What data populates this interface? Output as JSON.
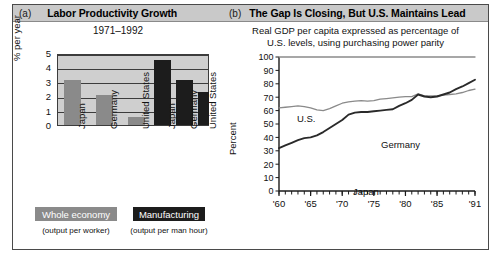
{
  "figure": {
    "panel_a": {
      "letter": "(a)",
      "title": "Labor Productivity Growth",
      "subtitle": "1971–1992",
      "legend": [
        {
          "label": "Whole economy",
          "sub": "(output per worker)",
          "color": "#8a8a8a"
        },
        {
          "label": "Manufacturing",
          "sub": "(output per man hour)",
          "color": "#1c1c1c"
        }
      ]
    },
    "panel_b": {
      "letter": "(b)",
      "title": "The Gap Is Closing, But U.S. Maintains Lead",
      "subtitle_line1": "Real GDP per capita expressed as percentage of",
      "subtitle_line2": "U.S. levels, using purchasing power parity",
      "series_labels": {
        "us": "U.S.",
        "germany": "Germany",
        "japan": "Japan"
      }
    }
  },
  "chart_data": [
    {
      "type": "bar",
      "title": "Labor Productivity Growth",
      "subtitle": "1971–1992",
      "xlabel": "",
      "ylabel": "% per year",
      "ylim": [
        0,
        5
      ],
      "yticks": [
        0,
        1,
        2,
        3,
        4,
        5
      ],
      "grid": true,
      "categories": [
        "Japan",
        "Germany",
        "United States",
        "Japan",
        "Germany",
        "United States"
      ],
      "series": [
        {
          "name": "Whole economy",
          "sublabel": "(output per worker)",
          "color": "#8a8a8a",
          "categories": [
            "Japan",
            "Germany",
            "United States"
          ],
          "values": [
            3.1,
            2.05,
            0.55
          ]
        },
        {
          "name": "Manufacturing",
          "sublabel": "(output per man hour)",
          "color": "#1c1c1c",
          "categories": [
            "Japan",
            "Germany",
            "United States"
          ],
          "values": [
            4.5,
            3.1,
            2.3
          ]
        }
      ]
    },
    {
      "type": "line",
      "title": "The Gap Is Closing, But U.S. Maintains Lead",
      "subtitle": "Real GDP per capita expressed as percentage of U.S. levels, using purchasing power parity",
      "xlabel": "",
      "ylabel": "Percent",
      "ylim": [
        0,
        100
      ],
      "yticks": [
        0,
        10,
        20,
        30,
        40,
        50,
        60,
        70,
        80,
        90,
        100
      ],
      "xlim": [
        1960,
        1991
      ],
      "xticks": [
        1960,
        1965,
        1970,
        1975,
        1980,
        1985,
        1991
      ],
      "xticklabels": [
        "'60",
        "'65",
        "'70",
        "'75",
        "'80",
        "'85",
        "'91"
      ],
      "minor_xticks": "every year 1960-1991",
      "grid": false,
      "x": [
        1960,
        1961,
        1962,
        1963,
        1964,
        1965,
        1966,
        1967,
        1968,
        1969,
        1970,
        1971,
        1972,
        1973,
        1974,
        1975,
        1976,
        1977,
        1978,
        1979,
        1980,
        1981,
        1982,
        1983,
        1984,
        1985,
        1986,
        1987,
        1988,
        1989,
        1990,
        1991
      ],
      "series": [
        {
          "name": "U.S.",
          "color": "#8a8a8a",
          "values": [
            100,
            100,
            100,
            100,
            100,
            100,
            100,
            100,
            100,
            100,
            100,
            100,
            100,
            100,
            100,
            100,
            100,
            100,
            100,
            100,
            100,
            100,
            100,
            100,
            100,
            100,
            100,
            100,
            100,
            100,
            100,
            100
          ]
        },
        {
          "name": "Germany",
          "color": "#8a8a8a",
          "values": [
            62,
            62.5,
            63,
            63.5,
            63,
            62,
            60.5,
            60,
            61.5,
            63.5,
            65.5,
            66.5,
            67,
            67.5,
            67,
            67.5,
            68.5,
            69,
            69.5,
            70,
            70.5,
            70.5,
            72.5,
            71,
            71,
            71,
            71.5,
            72,
            72.5,
            73.5,
            75,
            76
          ]
        },
        {
          "name": "Japan",
          "color": "#2a2a2a",
          "values": [
            32,
            34,
            36,
            38,
            39.5,
            40,
            41.5,
            44,
            47,
            50,
            53,
            57,
            58.5,
            59,
            59,
            59.5,
            60,
            60.5,
            61,
            63.5,
            65.5,
            68,
            72,
            70.5,
            70,
            70.5,
            72,
            73.5,
            76,
            78,
            80.5,
            83
          ]
        }
      ]
    }
  ]
}
